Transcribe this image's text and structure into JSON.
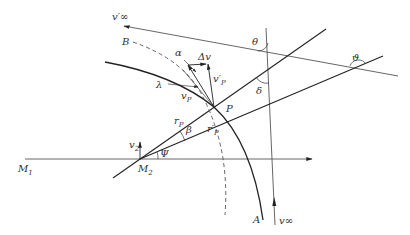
{
  "figure": {
    "type": "geometric-diagram",
    "labels": {
      "v_inf_prime": "v′∞",
      "v_inf": "v∞",
      "B": "B",
      "A": "A",
      "alpha": "α",
      "delta_v": "Δv",
      "lambda": "λ",
      "v_p": "v",
      "v_p_sub": "P",
      "v_p_prime": "v′",
      "v_p_prime_sub": "P",
      "P": "P",
      "theta": "θ",
      "delta": "δ",
      "vartheta": "ϑ",
      "r_p": "r",
      "r_p_sub": "P",
      "r_p_prime": "r′",
      "r_p_prime_sub": "P",
      "beta": "β",
      "psi": "Ψ",
      "v2": "v",
      "v2_sub": "2",
      "M1": "M",
      "M1_sub": "1",
      "M2": "M",
      "M2_sub": "2"
    },
    "colors": {
      "line": "#222222",
      "thin_line": "#555555",
      "text": "#333333",
      "background": "#ffffff"
    }
  }
}
